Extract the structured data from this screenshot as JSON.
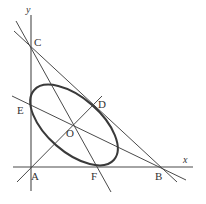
{
  "diagram": {
    "type": "coordinate-geometry",
    "axes": {
      "x_label": "x",
      "y_label": "y"
    },
    "points": {
      "A": {
        "label": "A",
        "x": 31,
        "y": 167
      },
      "B": {
        "label": "B",
        "x": 162,
        "y": 168
      },
      "C": {
        "label": "C",
        "x": 31,
        "y": 47
      },
      "D": {
        "label": "D",
        "x": 94,
        "y": 104
      },
      "E": {
        "label": "E",
        "x": 31,
        "y": 103
      },
      "F": {
        "label": "F",
        "x": 96,
        "y": 167
      },
      "O": {
        "label": "O",
        "x": 74,
        "y": 124
      }
    },
    "ellipse": {
      "center": "O",
      "rotation_deg": 40,
      "rx": 52,
      "ry": 27
    },
    "lines": [
      {
        "name": "line-CB",
        "through": [
          "C",
          "D",
          "B"
        ],
        "note": "tangent to ellipse at D"
      },
      {
        "name": "line-CF",
        "through": [
          "C",
          "F"
        ]
      },
      {
        "name": "line-EB",
        "through": [
          "E",
          "O",
          "B"
        ]
      },
      {
        "name": "line-AD",
        "through": [
          "A",
          "O",
          "D"
        ]
      }
    ],
    "colors": {
      "stroke": "#4a4a4a",
      "background": "#ffffff"
    }
  }
}
